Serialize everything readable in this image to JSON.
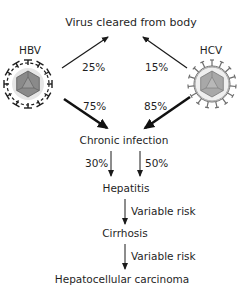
{
  "title": "Virus cleared from body",
  "viruses": [
    {
      "id": "hbv",
      "label": "HBV",
      "cleared_pct": "25%",
      "chronic_pct": "75%",
      "spike_color": "#1e1e1e",
      "capsid_color": "#8a8a8a"
    },
    {
      "id": "hcv",
      "label": "HCV",
      "cleared_pct": "15%",
      "chronic_pct": "85%",
      "spike_color": "#6e6e6e",
      "capsid_color": "#a8a8a8"
    }
  ],
  "stages": {
    "chronic": "Chronic infection",
    "hepatitis": "Hepatitis",
    "cirrhosis": "Cirrhosis",
    "carcinoma": "Hepatocellular carcinoma"
  },
  "transitions": {
    "chronic_to_hepatitis_left": "30%",
    "chronic_to_hepatitis_right": "50%",
    "hepatitis_to_cirrhosis": "Variable risk",
    "cirrhosis_to_carcinoma": "Variable risk"
  }
}
